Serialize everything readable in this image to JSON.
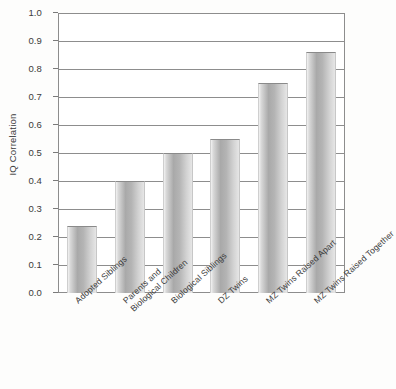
{
  "chart_data": {
    "type": "bar",
    "title": "",
    "xlabel": "",
    "ylabel": "IQ Correlation",
    "ylim": [
      0.0,
      1.0
    ],
    "grid": true,
    "legend": "none",
    "orientation": "vertical",
    "bar_color": "#b4b4b4",
    "categories": [
      "Adopted Siblings",
      "Parents and\nBiological Children",
      "Biological Siblings",
      "DZ Twins",
      "MZ Twins Raised Apart",
      "MZ Twins Raised Together"
    ],
    "values": [
      0.24,
      0.4,
      0.5,
      0.55,
      0.75,
      0.86
    ],
    "ytick_labels": [
      "1.0",
      "0.9",
      "0.8",
      "0.7",
      "0.6",
      "0.5",
      "0.4",
      "0.3",
      "0.2",
      "0.1",
      "0.0"
    ],
    "ytick_values": [
      1.0,
      0.9,
      0.8,
      0.7,
      0.6,
      0.5,
      0.4,
      0.3,
      0.2,
      0.1,
      0.0
    ]
  }
}
